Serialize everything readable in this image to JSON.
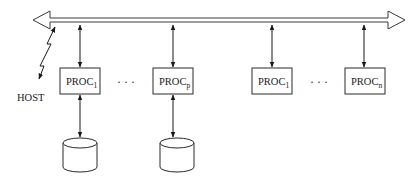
{
  "diagram": {
    "type": "shared-bus multiprocessor architecture",
    "bus": {
      "label": "",
      "direction": "bidirectional"
    },
    "host": {
      "label": "HOST"
    },
    "processors": [
      {
        "label": "PROC",
        "subscript": "1",
        "has_disk": true
      },
      {
        "label": "PROC",
        "subscript": "p",
        "has_disk": true
      },
      {
        "label": "PROC",
        "subscript": "1",
        "has_disk": false
      },
      {
        "label": "PROC",
        "subscript": "n",
        "has_disk": false
      }
    ],
    "ellipsis": [
      "· · ·",
      "· · ·"
    ],
    "colors": {
      "stroke": "#1a1a1a",
      "background": "#ffffff"
    }
  }
}
